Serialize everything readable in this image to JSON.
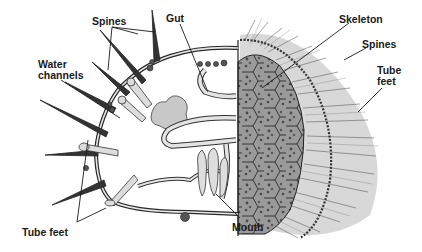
{
  "diagram": {
    "colors": {
      "background": "#ffffff",
      "ink": "#1a1a1a",
      "organ_fill": "#d9d9d9",
      "skeleton_fill": "#8c8c8c",
      "spine_shade": "#6e6e6e"
    },
    "labels": [
      {
        "id": "spines-left",
        "text": "Spines",
        "x": 92,
        "y": 16
      },
      {
        "id": "gut",
        "text": "Gut",
        "x": 166,
        "y": 13
      },
      {
        "id": "water-channels",
        "text": "Water\nchannels",
        "x": 38,
        "y": 59
      },
      {
        "id": "skeleton",
        "text": "Skeleton",
        "x": 339,
        "y": 14
      },
      {
        "id": "spines-right",
        "text": "Spines",
        "x": 362,
        "y": 39
      },
      {
        "id": "tube-feet-right",
        "text": "Tube\nfeet",
        "x": 377,
        "y": 65
      },
      {
        "id": "tube-feet-left",
        "text": "Tube feet",
        "x": 22,
        "y": 227
      },
      {
        "id": "mouth",
        "text": "Mouth",
        "x": 232,
        "y": 222
      }
    ]
  }
}
